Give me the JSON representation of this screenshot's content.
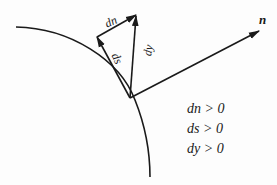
{
  "diagram": {
    "labels": {
      "dn": "dn",
      "ds": "ds",
      "dy": "dy",
      "n": "n"
    },
    "conditions": [
      "dn > 0",
      "ds > 0",
      "dy > 0"
    ],
    "colors": {
      "stroke": "#1a1a1a",
      "background": "#fdfdfd"
    }
  }
}
